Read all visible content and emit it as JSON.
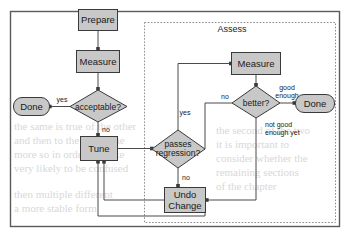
{
  "diagram": {
    "outer_frame": {
      "label": ""
    },
    "groups": [
      {
        "id": "assess",
        "label": "Assess"
      }
    ],
    "nodes": [
      {
        "id": "prepare",
        "label": "Prepare",
        "shape": "process"
      },
      {
        "id": "measure_left",
        "label": "Measure",
        "shape": "process"
      },
      {
        "id": "acceptable",
        "label": "acceptable?",
        "shape": "decision"
      },
      {
        "id": "done_left",
        "label": "Done",
        "shape": "terminal"
      },
      {
        "id": "tune",
        "label": "Tune",
        "shape": "process"
      },
      {
        "id": "passes_line1",
        "label": "passes",
        "shape": "decision"
      },
      {
        "id": "passes_line2",
        "label": "regression?",
        "shape": "decision"
      },
      {
        "id": "undo_line1",
        "label": "Undo",
        "shape": "process"
      },
      {
        "id": "undo_line2",
        "label": "Change",
        "shape": "process"
      },
      {
        "id": "measure_right",
        "label": "Measure",
        "shape": "process"
      },
      {
        "id": "better",
        "label": "better?",
        "shape": "decision"
      },
      {
        "id": "done_right",
        "label": "Done",
        "shape": "terminal"
      }
    ],
    "edge_labels": [
      {
        "id": "yes_acceptable",
        "label": "yes"
      },
      {
        "id": "no_acceptable",
        "label": "no"
      },
      {
        "id": "yes_passes",
        "label": "yes"
      },
      {
        "id": "no_passes",
        "label": "no"
      },
      {
        "id": "no_better",
        "label": "no"
      },
      {
        "id": "good_enough_l1",
        "label": "good"
      },
      {
        "id": "good_enough_l2",
        "label": "enough"
      },
      {
        "id": "not_good_l1",
        "label": "not good"
      },
      {
        "id": "not_good_l2",
        "label": "enough yet"
      }
    ],
    "colors": {
      "node_fill": "#c8c8c8",
      "node_stroke": "#3a3a3a",
      "edge": "#4a4a4a",
      "frame": "#5a5a5a",
      "group_frame": "#8c8c8c",
      "background": "#ffffff"
    },
    "background_bleed": [
      {
        "id": "bleed-1",
        "text": "the same is true of the other",
        "x": 14,
        "y": 128
      },
      {
        "id": "bleed-2",
        "text": "and then to the left of the",
        "x": 14,
        "y": 141
      },
      {
        "id": "bleed-3",
        "text": "more so in order to make",
        "x": 14,
        "y": 155
      },
      {
        "id": "bleed-4",
        "text": "very likely to be confused",
        "x": 14,
        "y": 168
      },
      {
        "id": "bleed-5",
        "text": "then multiple different",
        "x": 14,
        "y": 193
      },
      {
        "id": "bleed-6",
        "text": "a more stable form",
        "x": 14,
        "y": 207
      },
      {
        "id": "bleed-7",
        "text": "the second of the two",
        "x": 218,
        "y": 131
      },
      {
        "id": "bleed-8",
        "text": "it is important to",
        "x": 218,
        "y": 145
      },
      {
        "id": "bleed-9",
        "text": "consider whether the",
        "x": 218,
        "y": 159
      },
      {
        "id": "bleed-10",
        "text": "remaining sections",
        "x": 218,
        "y": 173
      },
      {
        "id": "bleed-11",
        "text": "of the chapter",
        "x": 218,
        "y": 187
      }
    ]
  }
}
